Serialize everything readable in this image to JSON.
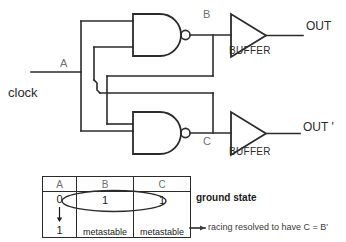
{
  "diagram": {
    "signals": {
      "input_a": "A",
      "clock": "clock",
      "node_b": "B",
      "node_c": "C",
      "out": "OUT",
      "out_prime": "OUT '"
    },
    "gates": {
      "buffer_top_label": "BUFFER",
      "buffer_bottom_label": "BUFFER",
      "nand_top": "nand-gate-top",
      "nand_bottom": "nand-gate-bottom"
    },
    "annotations": {
      "ground_state": "ground state",
      "racing": "racing resolved to have C = B'"
    },
    "colors": {
      "wire": "#2b2b2b",
      "label_gray": "#6f6f6f",
      "label_dark": "#2b2b2b",
      "background": "#ffffff"
    }
  },
  "truth_table": {
    "headers": [
      "A",
      "B",
      "C"
    ],
    "rows": [
      {
        "a_top": "0",
        "a_arrow": "down-arrow",
        "a_bottom": "1",
        "b_top": "1",
        "b_bottom": "metastable",
        "c_top": "1",
        "c_bottom": "metastable"
      }
    ]
  }
}
